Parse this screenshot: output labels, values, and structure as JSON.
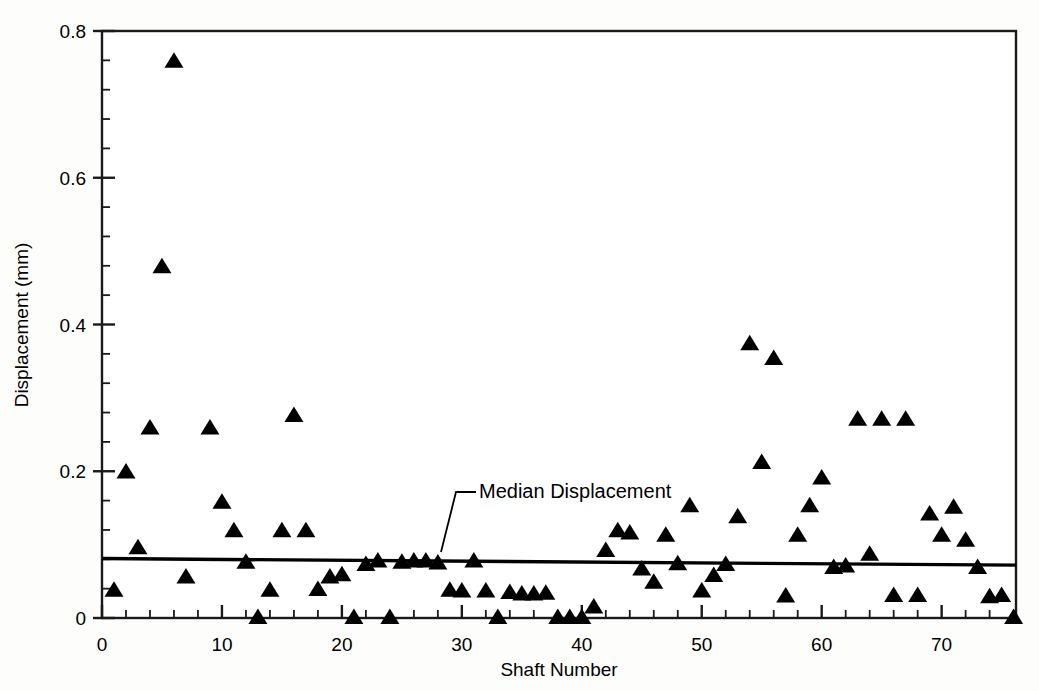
{
  "chart_data": {
    "type": "scatter",
    "title": "",
    "xlabel": "Shaft Number",
    "ylabel": "Displacement (mm)",
    "xlim": [
      0,
      76.2
    ],
    "ylim": [
      0,
      0.8
    ],
    "grid": false,
    "legend": null,
    "marker": "filled-triangle",
    "marker_color": "#000000",
    "x_major_ticks": [
      0,
      10,
      20,
      30,
      40,
      50,
      60,
      70
    ],
    "x_tick_labels": [
      "0",
      "10",
      "20",
      "30",
      "40",
      "50",
      "60",
      "70"
    ],
    "x_minor_tick_step": 2,
    "y_major_ticks": [
      0,
      0.2,
      0.4,
      0.6,
      0.8
    ],
    "y_tick_labels": [
      "0",
      "0.2",
      "0.4",
      "0.6",
      "0.8"
    ],
    "y_minor_tick_step": 0.04,
    "series": [
      {
        "name": "Displacement",
        "points": [
          [
            1,
            0.037
          ],
          [
            2,
            0.198
          ],
          [
            3,
            0.095
          ],
          [
            4,
            0.258
          ],
          [
            5,
            0.478
          ],
          [
            6,
            0.758
          ],
          [
            7,
            0.055
          ],
          [
            9,
            0.258
          ],
          [
            10,
            0.157
          ],
          [
            11,
            0.118
          ],
          [
            12,
            0.075
          ],
          [
            13,
            0.0
          ],
          [
            14,
            0.037
          ],
          [
            15,
            0.118
          ],
          [
            16,
            0.275
          ],
          [
            17,
            0.118
          ],
          [
            18,
            0.038
          ],
          [
            19,
            0.055
          ],
          [
            20,
            0.058
          ],
          [
            21,
            0.0
          ],
          [
            22,
            0.072
          ],
          [
            23,
            0.077
          ],
          [
            24,
            0.0
          ],
          [
            25,
            0.075
          ],
          [
            26,
            0.077
          ],
          [
            27,
            0.077
          ],
          [
            28,
            0.074
          ],
          [
            29,
            0.037
          ],
          [
            30,
            0.036
          ],
          [
            31,
            0.077
          ],
          [
            32,
            0.036
          ],
          [
            33,
            0.0
          ],
          [
            34,
            0.034
          ],
          [
            35,
            0.032
          ],
          [
            36,
            0.032
          ],
          [
            37,
            0.033
          ],
          [
            38,
            0.0
          ],
          [
            39,
            0.0
          ],
          [
            40,
            0.0
          ],
          [
            41,
            0.014
          ],
          [
            42,
            0.091
          ],
          [
            43,
            0.118
          ],
          [
            44,
            0.115
          ],
          [
            45,
            0.066
          ],
          [
            46,
            0.048
          ],
          [
            47,
            0.112
          ],
          [
            48,
            0.073
          ],
          [
            49,
            0.152
          ],
          [
            50,
            0.036
          ],
          [
            51,
            0.057
          ],
          [
            52,
            0.072
          ],
          [
            53,
            0.137
          ],
          [
            54,
            0.373
          ],
          [
            55,
            0.211
          ],
          [
            56,
            0.353
          ],
          [
            57,
            0.029
          ],
          [
            58,
            0.112
          ],
          [
            59,
            0.152
          ],
          [
            60,
            0.19
          ],
          [
            61,
            0.068
          ],
          [
            62,
            0.07
          ],
          [
            63,
            0.27
          ],
          [
            64,
            0.086
          ],
          [
            65,
            0.27
          ],
          [
            66,
            0.03
          ],
          [
            67,
            0.27
          ],
          [
            68,
            0.03
          ],
          [
            69,
            0.141
          ],
          [
            70,
            0.112
          ],
          [
            71,
            0.15
          ],
          [
            72,
            0.105
          ],
          [
            73,
            0.068
          ],
          [
            74,
            0.028
          ],
          [
            75,
            0.03
          ],
          [
            76,
            0.0
          ]
        ]
      }
    ],
    "reference_line": {
      "label": "Median Displacement",
      "value_left": 0.081,
      "value_right": 0.072,
      "color": "#000000"
    }
  },
  "annotations": {
    "median_label": "Median Displacement"
  }
}
